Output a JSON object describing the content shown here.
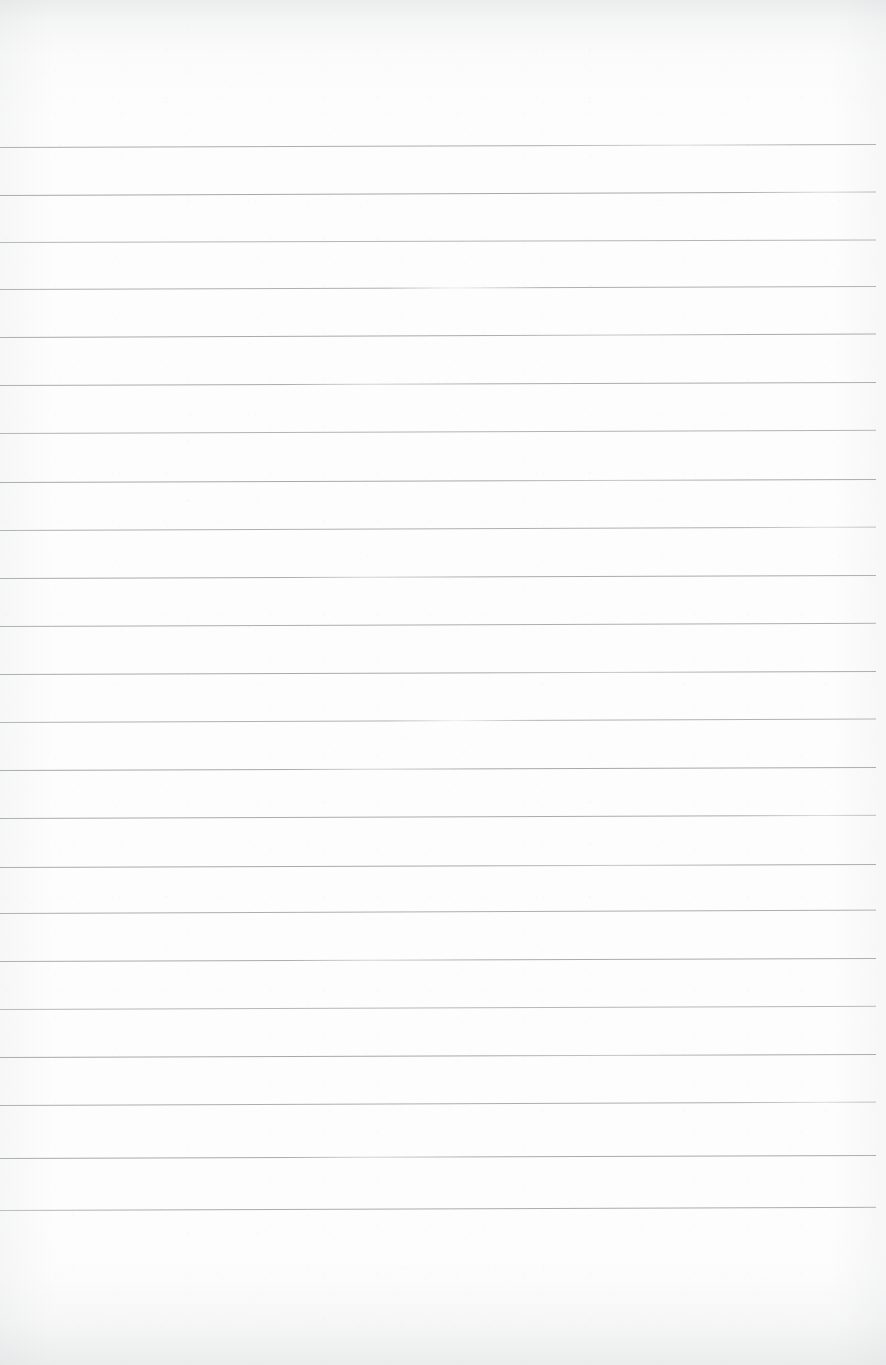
{
  "document": {
    "kind": "scanned-ruled-paper",
    "description": "Blank scanned sheet of wide-ruled notebook paper, no handwriting or printed text",
    "page_width": 886,
    "page_height": 1365,
    "text_content": "",
    "visible_text": []
  },
  "paper": {
    "background_color": "#fdfdfd",
    "edge_shadow_color": "#c6c8ca",
    "grain_color": "#aaacaf"
  },
  "ruling": {
    "line_color": "#9a9c9e",
    "line_count": 23,
    "first_line_y": 147,
    "last_line_y": 1210,
    "spacing_px": 48.3,
    "left_x": 0,
    "right_x": 876,
    "top_margin_px": 147,
    "bottom_margin_px": 155,
    "lines": [
      {
        "y": 147,
        "slant": -3.0,
        "thickness": 1.5,
        "opacity": 0.82,
        "fade": "mid-right"
      },
      {
        "y": 195,
        "slant": -3.5,
        "thickness": 1.7,
        "opacity": 0.88,
        "fade": "right-end"
      },
      {
        "y": 242,
        "slant": -2.5,
        "thickness": 1.3,
        "opacity": 0.74,
        "fade": "even"
      },
      {
        "y": 289,
        "slant": -3.0,
        "thickness": 1.5,
        "opacity": 0.8,
        "fade": "center-break"
      },
      {
        "y": 337,
        "slant": -3.5,
        "thickness": 1.6,
        "opacity": 0.86,
        "fade": "left-strong"
      },
      {
        "y": 385,
        "slant": -3.0,
        "thickness": 1.6,
        "opacity": 0.84,
        "fade": "mid-dip"
      },
      {
        "y": 433,
        "slant": -3.2,
        "thickness": 1.4,
        "opacity": 0.76,
        "fade": "even"
      },
      {
        "y": 482,
        "slant": -3.0,
        "thickness": 1.7,
        "opacity": 0.88,
        "fade": "left-strong"
      },
      {
        "y": 530,
        "slant": -3.4,
        "thickness": 1.5,
        "opacity": 0.8,
        "fade": "right-end"
      },
      {
        "y": 578,
        "slant": -3.0,
        "thickness": 1.6,
        "opacity": 0.85,
        "fade": "mid-dip"
      },
      {
        "y": 626,
        "slant": -3.2,
        "thickness": 1.5,
        "opacity": 0.82,
        "fade": "even"
      },
      {
        "y": 674,
        "slant": -3.0,
        "thickness": 1.6,
        "opacity": 0.86,
        "fade": "left-strong"
      },
      {
        "y": 722,
        "slant": -3.5,
        "thickness": 1.4,
        "opacity": 0.78,
        "fade": "center-break"
      },
      {
        "y": 770,
        "slant": -3.0,
        "thickness": 1.7,
        "opacity": 0.88,
        "fade": "mid-dip"
      },
      {
        "y": 818,
        "slant": -3.2,
        "thickness": 1.6,
        "opacity": 0.84,
        "fade": "right-end"
      },
      {
        "y": 867,
        "slant": -3.0,
        "thickness": 1.6,
        "opacity": 0.86,
        "fade": "left-strong"
      },
      {
        "y": 913,
        "slant": -3.4,
        "thickness": 1.5,
        "opacity": 0.82,
        "fade": "even"
      },
      {
        "y": 961,
        "slant": -3.0,
        "thickness": 1.6,
        "opacity": 0.85,
        "fade": "mid-dip"
      },
      {
        "y": 1009,
        "slant": -3.2,
        "thickness": 1.3,
        "opacity": 0.72,
        "fade": "even"
      },
      {
        "y": 1057,
        "slant": -3.0,
        "thickness": 1.7,
        "opacity": 0.88,
        "fade": "left-strong"
      },
      {
        "y": 1105,
        "slant": -3.4,
        "thickness": 1.5,
        "opacity": 0.82,
        "fade": "right-end"
      },
      {
        "y": 1158,
        "slant": -3.0,
        "thickness": 1.6,
        "opacity": 0.86,
        "fade": "mid-dip"
      },
      {
        "y": 1210,
        "slant": -3.2,
        "thickness": 1.6,
        "opacity": 0.84,
        "fade": "left-wobble"
      }
    ]
  }
}
